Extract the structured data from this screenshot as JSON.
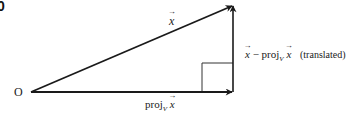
{
  "figure": {
    "panel_label": "0",
    "origin_label": "O",
    "labels": {
      "hypotenuse": {
        "vec": "x"
      },
      "projection": {
        "prefix": "proj",
        "subscript": "V",
        "vec": "x"
      },
      "difference": {
        "vec": "x",
        "minus": " − ",
        "prefix": "proj",
        "subscript": "V",
        "vec2": "x",
        "note": "(translated)"
      }
    },
    "geometry": {
      "origin": [
        31,
        92
      ],
      "apex": [
        233,
        5
      ],
      "foot": [
        233,
        92
      ],
      "right_angle_square": {
        "x": 202,
        "y": 63,
        "size": 31
      }
    },
    "colors": {
      "stroke": "#1a1a1a",
      "square": "#333333",
      "background": "#ffffff"
    }
  }
}
